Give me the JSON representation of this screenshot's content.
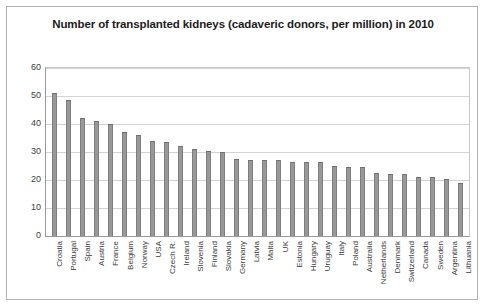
{
  "chart_data": {
    "type": "bar",
    "title": "Number of transplanted kidneys (cadaveric donors, per million) in 2010",
    "xlabel": "",
    "ylabel": "",
    "ylim": [
      0,
      60
    ],
    "yticks": [
      60,
      50,
      40,
      30,
      20,
      10,
      0
    ],
    "grid": true,
    "legend": "none",
    "bar_color": "#989898",
    "categories": [
      "Croatia",
      "Portugal",
      "Spain",
      "Austria",
      "France",
      "Belgium",
      "Norway",
      "USA",
      "Czech R.",
      "Ireland",
      "Slovenia",
      "Finland",
      "Slovakia",
      "Germany",
      "Latvia",
      "Malta",
      "UK",
      "Estonia",
      "Hungary",
      "Uruguay",
      "Italy",
      "Poland",
      "Australia",
      "Netherlands",
      "Denmark",
      "Switzerland",
      "Canada",
      "Sweden",
      "Argentina",
      "Lithuania"
    ],
    "values": [
      51,
      48.5,
      42,
      41,
      40,
      37,
      36,
      34,
      33.5,
      32,
      31,
      30.5,
      30,
      27.5,
      27,
      27,
      27,
      26.5,
      26.5,
      26.5,
      25,
      24.5,
      24.5,
      22.5,
      22,
      22,
      21,
      21,
      20.5,
      19
    ]
  }
}
